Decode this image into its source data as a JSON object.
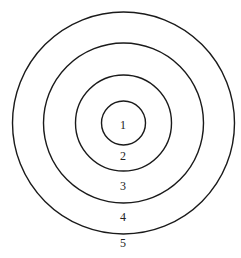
{
  "diagram": {
    "type": "concentric-circles",
    "center": {
      "x": 123.5,
      "y": 123
    },
    "stroke_color": "#1a1a1a",
    "rings": [
      {
        "id": "ring-1",
        "radius": 22
      },
      {
        "id": "ring-2",
        "radius": 48
      },
      {
        "id": "ring-3",
        "radius": 80
      },
      {
        "id": "ring-4",
        "radius": 111
      }
    ],
    "labels": [
      {
        "text": "1",
        "x": 123,
        "y": 126
      },
      {
        "text": "2",
        "x": 123,
        "y": 157
      },
      {
        "text": "3",
        "x": 123,
        "y": 187
      },
      {
        "text": "4",
        "x": 123,
        "y": 218
      },
      {
        "text": "5",
        "x": 123,
        "y": 244
      }
    ]
  }
}
